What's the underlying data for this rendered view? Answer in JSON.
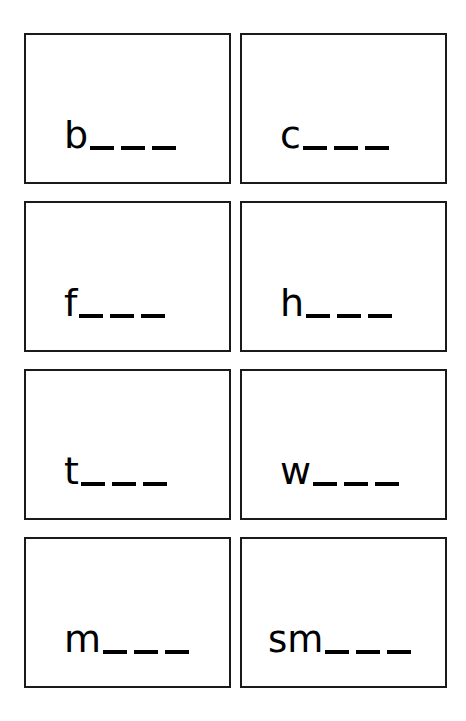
{
  "document": {
    "title": "Phonics Word Building Cards",
    "kind": "worksheet-card-grid",
    "background_color": "#ffffff",
    "ink_color": "#000000",
    "border_color": "#1a1a1a",
    "columns": 2,
    "rows": 4
  },
  "cards": [
    {
      "id": "card-1",
      "row": 1,
      "column": 1,
      "stem": "b",
      "blank_count": 3,
      "full_text": "b___"
    },
    {
      "id": "card-2",
      "row": 1,
      "column": 2,
      "stem": "c",
      "blank_count": 3,
      "full_text": "c___"
    },
    {
      "id": "card-3",
      "row": 2,
      "column": 1,
      "stem": "f",
      "blank_count": 3,
      "full_text": "f___"
    },
    {
      "id": "card-4",
      "row": 2,
      "column": 2,
      "stem": "h",
      "blank_count": 3,
      "full_text": "h___"
    },
    {
      "id": "card-5",
      "row": 3,
      "column": 1,
      "stem": "t",
      "blank_count": 3,
      "full_text": "t___"
    },
    {
      "id": "card-6",
      "row": 3,
      "column": 2,
      "stem": "w",
      "blank_count": 3,
      "full_text": "w___"
    },
    {
      "id": "card-7",
      "row": 4,
      "column": 1,
      "stem": "m",
      "blank_count": 3,
      "full_text": "m___"
    },
    {
      "id": "card-8",
      "row": 4,
      "column": 2,
      "stem": "sm",
      "blank_count": 3,
      "full_text": "sm___"
    }
  ]
}
